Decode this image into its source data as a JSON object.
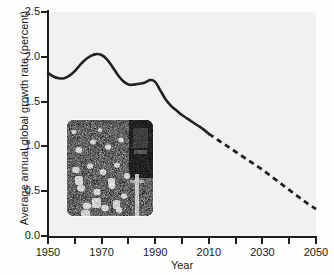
{
  "chart_data": {
    "type": "line",
    "title": "",
    "xlabel": "Year",
    "ylabel": "Average annual global growth rate (percent)",
    "xlim": [
      1950,
      2050
    ],
    "ylim": [
      0.0,
      2.5
    ],
    "grid": false,
    "legend": "none",
    "x_ticks_major": [
      "1950",
      "1970",
      "1990",
      "2010",
      "2030",
      "2050"
    ],
    "x_ticks_major_values": [
      1950,
      1970,
      1990,
      2010,
      2030,
      2050
    ],
    "x_ticks_minor_values": [
      1960,
      1980,
      2000,
      2020,
      2040
    ],
    "y_ticks": [
      "0.0",
      "0.5",
      "1.0",
      "1.5",
      "2.0",
      "2.5"
    ],
    "y_tick_values": [
      0.0,
      0.5,
      1.0,
      1.5,
      2.0,
      2.5
    ],
    "line_color": "#222222",
    "plot_background": "#f1f1ef",
    "series": [
      {
        "name": "Historical average annual global growth rate",
        "style": "solid",
        "x": [
          1950,
          1952,
          1954,
          1956,
          1958,
          1960,
          1962,
          1964,
          1966,
          1968,
          1970,
          1972,
          1974,
          1976,
          1978,
          1980,
          1982,
          1984,
          1986,
          1988,
          1990,
          1992,
          1994,
          1996,
          1998,
          2000,
          2002,
          2004,
          2006,
          2008,
          2010
        ],
        "values": [
          1.82,
          1.78,
          1.76,
          1.76,
          1.79,
          1.84,
          1.91,
          1.97,
          2.01,
          2.03,
          2.02,
          1.97,
          1.89,
          1.8,
          1.73,
          1.69,
          1.69,
          1.7,
          1.71,
          1.74,
          1.72,
          1.62,
          1.52,
          1.45,
          1.4,
          1.35,
          1.31,
          1.27,
          1.23,
          1.19,
          1.14
        ]
      },
      {
        "name": "Projected average annual global growth rate",
        "style": "dashed",
        "x": [
          2010,
          2014,
          2018,
          2022,
          2026,
          2030,
          2034,
          2038,
          2042,
          2046,
          2050
        ],
        "values": [
          1.14,
          1.06,
          0.98,
          0.9,
          0.82,
          0.74,
          0.65,
          0.56,
          0.47,
          0.38,
          0.3
        ]
      }
    ],
    "annotations": [
      {
        "type": "inset-image",
        "name": "crowd-photograph",
        "description": "Black and white photograph of a dense crowd of people",
        "x_range": [
          1957,
          1989
        ],
        "y_range": [
          0.23,
          1.3
        ]
      }
    ]
  }
}
